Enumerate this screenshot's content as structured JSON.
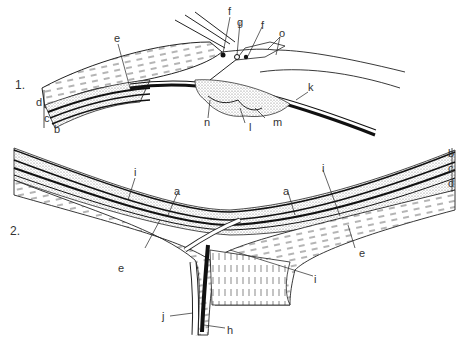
{
  "figures": [
    {
      "number": "1.",
      "labels": [
        "e",
        "f",
        "g",
        "f",
        "o",
        "d",
        "c",
        "b",
        "n",
        "l",
        "m",
        "k"
      ]
    },
    {
      "number": "2.",
      "labels": [
        "i",
        "a",
        "e",
        "a",
        "i",
        "e",
        "i",
        "j",
        "h",
        "b",
        "c",
        "d"
      ]
    }
  ],
  "labels": {
    "fig1_number": "1.",
    "fig1_e": "e",
    "fig1_f1": "f",
    "fig1_g": "g",
    "fig1_f2": "f",
    "fig1_o": "o",
    "fig1_d": "d",
    "fig1_c": "c",
    "fig1_b": "b",
    "fig1_n": "n",
    "fig1_l": "l",
    "fig1_m": "m",
    "fig1_k": "k",
    "fig2_number": "2.",
    "fig2_i_left": "i",
    "fig2_a_left": "a",
    "fig2_e_left": "e",
    "fig2_a_right": "a",
    "fig2_i_right": "i",
    "fig2_e_right": "e",
    "fig2_i_lower": "i",
    "fig2_j": "j",
    "fig2_h": "h",
    "fig2_b": "b",
    "fig2_c": "c",
    "fig2_d": "d"
  },
  "colors": {
    "line": "#222222",
    "stipple": "#9a9a9a",
    "background": "#ffffff"
  }
}
